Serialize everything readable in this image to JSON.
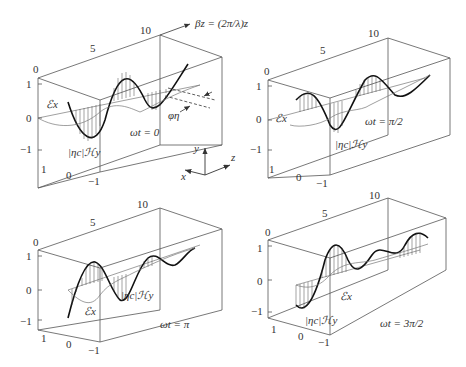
{
  "figure": {
    "title_arrow_label": "βz = (2π/λ)z",
    "axes_triad": {
      "y": "y",
      "z": "z",
      "x": "x"
    },
    "phase_label": "φη",
    "panels": [
      {
        "id": "p1",
        "time_label": "ωt = 0",
        "e_label": "ℰx",
        "h_label": "|ηc|ℋy",
        "z_ticks": [
          "0",
          "5",
          "10"
        ],
        "y_ticks": [
          "1",
          "0",
          "−1"
        ],
        "x_ticks": [
          "1",
          "0",
          "−1"
        ]
      },
      {
        "id": "p2",
        "time_label": "ωt = π/2",
        "e_label": "ℰx",
        "h_label": "|ηc|ℋy",
        "z_ticks": [
          "0",
          "5",
          "10"
        ],
        "y_ticks": [
          "1",
          "0",
          "−1"
        ],
        "x_ticks": [
          "1",
          "0",
          "−1"
        ]
      },
      {
        "id": "p3",
        "time_label": "ωt = π",
        "e_label": "ℰx",
        "h_label": "|ηc|ℋy",
        "z_ticks": [
          "0",
          "5",
          "10"
        ],
        "y_ticks": [
          "1",
          "0",
          "−1"
        ],
        "x_ticks": [
          "1",
          "0",
          "−1"
        ]
      },
      {
        "id": "p4",
        "time_label": "ωt = 3π/2",
        "e_label": "ℰx",
        "h_label": "|ηc|ℋy",
        "z_ticks": [
          "0",
          "5",
          "10"
        ],
        "y_ticks": [
          "1",
          "0",
          "−1"
        ],
        "x_ticks": [
          "1",
          "0",
          "−1"
        ]
      }
    ]
  }
}
